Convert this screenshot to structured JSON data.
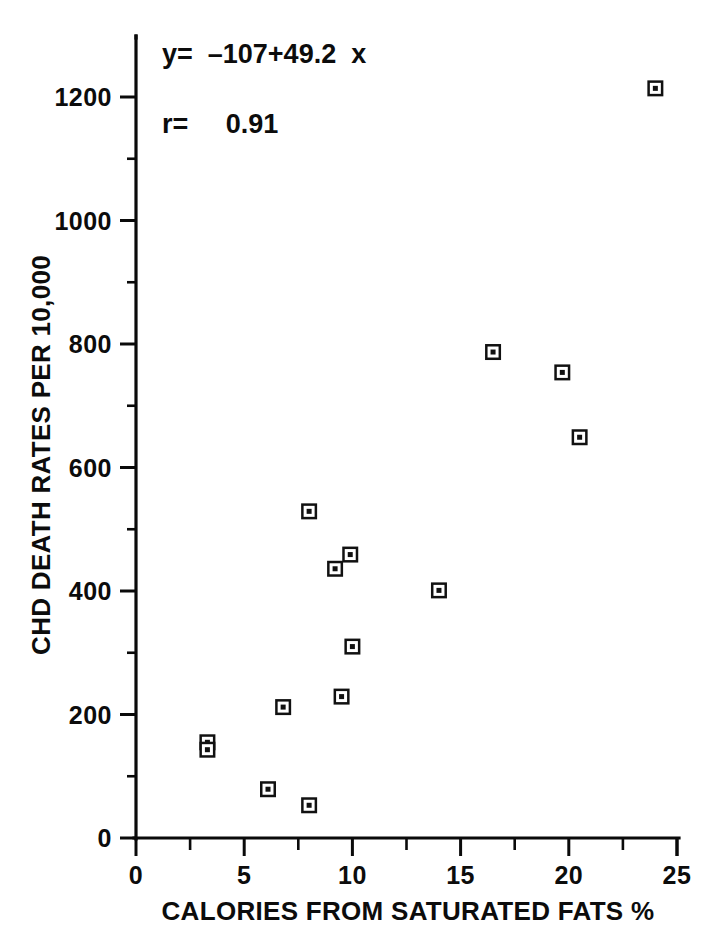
{
  "chart_data": {
    "type": "scatter",
    "title": "",
    "xlabel": "CALORIES FROM SATURATED FATS %",
    "ylabel": "CHD DEATH RATES PER 10,000",
    "xlim": [
      0,
      25
    ],
    "ylim": [
      0,
      1270
    ],
    "xticks": [
      0,
      5,
      10,
      15,
      20,
      25
    ],
    "yticks": [
      0,
      200,
      400,
      600,
      800,
      1000,
      1200
    ],
    "xtick_labels": [
      "0",
      "5",
      "10",
      "15",
      "20",
      "25"
    ],
    "ytick_labels": [
      "0",
      "200",
      "400",
      "600",
      "800",
      "1000",
      "1200"
    ],
    "x_minor_tick_step": 2.5,
    "y_minor_tick_step": 100,
    "grid": false,
    "legend": "none",
    "marker": "open-square",
    "points": [
      {
        "x": 3.3,
        "y": 155
      },
      {
        "x": 3.3,
        "y": 143
      },
      {
        "x": 6.1,
        "y": 79
      },
      {
        "x": 6.8,
        "y": 212
      },
      {
        "x": 8.0,
        "y": 53
      },
      {
        "x": 8.0,
        "y": 529
      },
      {
        "x": 9.2,
        "y": 436
      },
      {
        "x": 9.5,
        "y": 229
      },
      {
        "x": 9.9,
        "y": 459
      },
      {
        "x": 10.0,
        "y": 310
      },
      {
        "x": 14.0,
        "y": 401
      },
      {
        "x": 16.5,
        "y": 787
      },
      {
        "x": 19.7,
        "y": 754
      },
      {
        "x": 20.5,
        "y": 649
      },
      {
        "x": 24.0,
        "y": 1214
      }
    ],
    "annotations": [
      {
        "id": "regression-equation",
        "text": "y=  –107+49.2  x",
        "x_px": 162,
        "y_px": 63
      },
      {
        "id": "correlation-coefficient",
        "text": "r=     0.91",
        "x_px": 162,
        "y_px": 133
      }
    ],
    "fit": {
      "intercept": -107,
      "slope": 49.2,
      "r": 0.91,
      "equation_label": "y=  –107+49.2  x",
      "r_label": "r=     0.91"
    }
  },
  "axes": {
    "x_axis_name": "calories-from-saturated-fats-axis",
    "y_axis_name": "chd-death-rates-axis"
  }
}
